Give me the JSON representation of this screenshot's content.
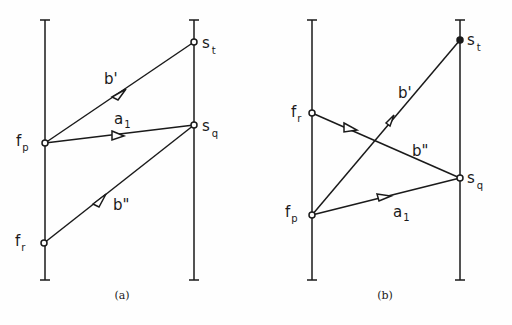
{
  "diagrams": [
    {
      "caption": "(a)",
      "left_line": {
        "x": 45,
        "top": 20,
        "bottom": 280
      },
      "right_line": {
        "x": 194,
        "top": 20,
        "bottom": 280
      },
      "nodes": {
        "s_t": {
          "base": "s",
          "sub": "t",
          "x": 194,
          "y": 42
        },
        "s_q": {
          "base": "s",
          "sub": "q",
          "x": 194,
          "y": 125
        },
        "f_p": {
          "base": "f",
          "sub": "p",
          "x": 45,
          "y": 143
        },
        "f_r": {
          "base": "f",
          "sub": "r",
          "x": 44,
          "y": 243
        }
      },
      "edges": [
        {
          "label": "b'",
          "from": "f_p",
          "to": "s_t"
        },
        {
          "label": "a",
          "label_sub": "1",
          "from": "f_p",
          "to": "s_q"
        },
        {
          "label": "b\"",
          "from": "f_r",
          "to": "s_q"
        }
      ]
    },
    {
      "caption": "(b)",
      "left_line": {
        "x": 312,
        "top": 20,
        "bottom": 280
      },
      "right_line": {
        "x": 460,
        "top": 20,
        "bottom": 280
      },
      "nodes": {
        "s_t": {
          "base": "s",
          "sub": "t",
          "x": 460,
          "y": 40
        },
        "s_q": {
          "base": "s",
          "sub": "q",
          "x": 460,
          "y": 178
        },
        "f_r": {
          "base": "f",
          "sub": "r",
          "x": 312,
          "y": 113
        },
        "f_p": {
          "base": "f",
          "sub": "p",
          "x": 312,
          "y": 215
        }
      },
      "edges": [
        {
          "label": "b'",
          "from": "f_p",
          "to": "s_t"
        },
        {
          "label": "b\"",
          "from": "f_r",
          "to": "s_q"
        },
        {
          "label": "a",
          "label_sub": "1",
          "from": "f_p",
          "to": "s_q"
        }
      ]
    }
  ],
  "labels": {
    "a_st_base": "s",
    "a_st_sub": "t",
    "a_sq_base": "s",
    "a_sq_sub": "q",
    "a_fp_base": "f",
    "a_fp_sub": "p",
    "a_fr_base": "f",
    "a_fr_sub": "r",
    "a_bprime": "b'",
    "a_a1_base": "a",
    "a_a1_sub": "1",
    "a_bdouble": "b\"",
    "b_st_base": "s",
    "b_st_sub": "t",
    "b_sq_base": "s",
    "b_sq_sub": "q",
    "b_fp_base": "f",
    "b_fp_sub": "p",
    "b_fr_base": "f",
    "b_fr_sub": "r",
    "b_bprime": "b'",
    "b_a1_base": "a",
    "b_a1_sub": "1",
    "b_bdouble": "b\"",
    "caption_a": "(a)",
    "caption_b": "(b)"
  }
}
